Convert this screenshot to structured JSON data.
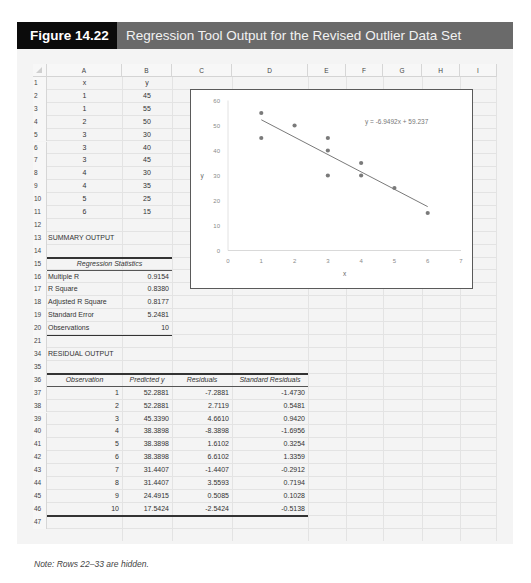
{
  "banner": {
    "figure_label": "Figure 14.22",
    "title": "Regression Tool Output for the Revised Outlier Data Set"
  },
  "sheet": {
    "columns": [
      "A",
      "B",
      "C",
      "D",
      "E",
      "F",
      "G",
      "H",
      "I"
    ],
    "input_data": {
      "headers": [
        "x",
        "y"
      ],
      "rows": [
        {
          "row": "2",
          "x": "1",
          "y": "45"
        },
        {
          "row": "3",
          "x": "1",
          "y": "55"
        },
        {
          "row": "4",
          "x": "2",
          "y": "50"
        },
        {
          "row": "5",
          "x": "3",
          "y": "30"
        },
        {
          "row": "6",
          "x": "3",
          "y": "40"
        },
        {
          "row": "7",
          "x": "3",
          "y": "45"
        },
        {
          "row": "8",
          "x": "4",
          "y": "30"
        },
        {
          "row": "9",
          "x": "4",
          "y": "35"
        },
        {
          "row": "10",
          "x": "5",
          "y": "25"
        },
        {
          "row": "11",
          "x": "6",
          "y": "15"
        }
      ]
    },
    "summary_output_label": "SUMMARY OUTPUT",
    "regression_statistics": {
      "header": "Regression Statistics",
      "rows": [
        {
          "row": "16",
          "label": "Multiple R",
          "value": "0.9154"
        },
        {
          "row": "17",
          "label": "R Square",
          "value": "0.8380"
        },
        {
          "row": "18",
          "label": "Adjusted R Square",
          "value": "0.8177"
        },
        {
          "row": "19",
          "label": "Standard Error",
          "value": "5.2481"
        },
        {
          "row": "20",
          "label": "Observations",
          "value": "10"
        }
      ]
    },
    "residual_output_label": "RESIDUAL OUTPUT",
    "residual_output": {
      "headers": [
        "Observation",
        "Predicted y",
        "Residuals",
        "Standard Residuals"
      ],
      "rows": [
        {
          "row": "37",
          "obs": "1",
          "pred": "52.2881",
          "resid": "-7.2881",
          "std": "-1.4730"
        },
        {
          "row": "38",
          "obs": "2",
          "pred": "52.2881",
          "resid": "2.7119",
          "std": "0.5481"
        },
        {
          "row": "39",
          "obs": "3",
          "pred": "45.3390",
          "resid": "4.6610",
          "std": "0.9420"
        },
        {
          "row": "40",
          "obs": "4",
          "pred": "38.3898",
          "resid": "-8.3898",
          "std": "-1.6956"
        },
        {
          "row": "41",
          "obs": "5",
          "pred": "38.3898",
          "resid": "1.6102",
          "std": "0.3254"
        },
        {
          "row": "42",
          "obs": "6",
          "pred": "38.3898",
          "resid": "6.6102",
          "std": "1.3359"
        },
        {
          "row": "43",
          "obs": "7",
          "pred": "31.4407",
          "resid": "-1.4407",
          "std": "-0.2912"
        },
        {
          "row": "44",
          "obs": "8",
          "pred": "31.4407",
          "resid": "3.5593",
          "std": "0.7194"
        },
        {
          "row": "45",
          "obs": "9",
          "pred": "24.4915",
          "resid": "0.5085",
          "std": "0.1028"
        },
        {
          "row": "46",
          "obs": "10",
          "pred": "17.5424",
          "resid": "-2.5424",
          "std": "-0.5138"
        }
      ]
    },
    "row_numbers": {
      "r1": "1",
      "r12": "12",
      "r13": "13",
      "r14": "14",
      "r15": "15",
      "r21": "21",
      "r34": "34",
      "r35": "35",
      "r36": "36",
      "r47": "47"
    }
  },
  "chart_data": {
    "type": "scatter",
    "title": "",
    "xlabel": "x",
    "ylabel": "y",
    "xlim": [
      0,
      7
    ],
    "ylim": [
      0,
      60
    ],
    "x_ticks": [
      "0",
      "1",
      "2",
      "3",
      "4",
      "5",
      "6",
      "7"
    ],
    "y_ticks": [
      "0",
      "10",
      "20",
      "30",
      "40",
      "50",
      "60"
    ],
    "grid": false,
    "legend": "none",
    "series": [
      {
        "name": "y",
        "x": [
          1,
          1,
          2,
          3,
          3,
          3,
          4,
          4,
          5,
          6
        ],
        "y": [
          45,
          55,
          50,
          30,
          40,
          45,
          30,
          35,
          25,
          15
        ]
      }
    ],
    "trendline": {
      "type": "linear",
      "slope": -6.9492,
      "intercept": 59.237,
      "x_range": [
        1,
        6
      ],
      "equation_label": "y = -6.9492x + 59.237"
    },
    "colors": {
      "points": "#7a7a7a",
      "trendline": "#6a6a6a",
      "axis_text": "#8a8a8a"
    }
  },
  "note": "Note: Rows 22–33 are hidden."
}
